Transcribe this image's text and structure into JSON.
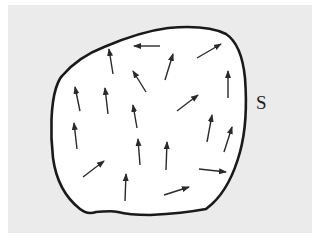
{
  "diagram": {
    "title": "",
    "background_color": "#ebebeb",
    "region_fill": "#ffffff",
    "outline_color": "#1a1a1a",
    "arrow_color": "#2a2a2a",
    "surface_label": "S",
    "region_path": "M 62 76 C 72 64 86 54 104 47 C 125 38 145 31 168 28 C 190 26 212 27 226 34 C 238 42 243 58 245 78 C 247 105 246 130 240 152 C 234 174 225 192 212 204 L 206 209 C 190 212 170 214 150 215 C 135 215 125 214 118 212 C 110 210 103 212 96 212 C 90 214 85 213 80 209 C 66 198 56 180 53 158 C 50 132 51 104 56 88 C 58 82 60 78 62 76 Z",
    "arrows": [
      {
        "x1": 160,
        "y1": 46,
        "x2": 134,
        "y2": 46
      },
      {
        "x1": 113,
        "y1": 74,
        "x2": 109,
        "y2": 49
      },
      {
        "x1": 146,
        "y1": 92,
        "x2": 133,
        "y2": 71
      },
      {
        "x1": 165,
        "y1": 80,
        "x2": 173,
        "y2": 54
      },
      {
        "x1": 197,
        "y1": 58,
        "x2": 221,
        "y2": 44
      },
      {
        "x1": 228,
        "y1": 98,
        "x2": 228,
        "y2": 71
      },
      {
        "x1": 80,
        "y1": 111,
        "x2": 75,
        "y2": 87
      },
      {
        "x1": 108,
        "y1": 114,
        "x2": 105,
        "y2": 88
      },
      {
        "x1": 137,
        "y1": 128,
        "x2": 133,
        "y2": 105
      },
      {
        "x1": 177,
        "y1": 111,
        "x2": 198,
        "y2": 95
      },
      {
        "x1": 77,
        "y1": 149,
        "x2": 74,
        "y2": 123
      },
      {
        "x1": 140,
        "y1": 165,
        "x2": 138,
        "y2": 139
      },
      {
        "x1": 166,
        "y1": 170,
        "x2": 167,
        "y2": 142
      },
      {
        "x1": 207,
        "y1": 142,
        "x2": 212,
        "y2": 115
      },
      {
        "x1": 224,
        "y1": 152,
        "x2": 232,
        "y2": 127
      },
      {
        "x1": 83,
        "y1": 177,
        "x2": 104,
        "y2": 161
      },
      {
        "x1": 125,
        "y1": 201,
        "x2": 126,
        "y2": 174
      },
      {
        "x1": 199,
        "y1": 169,
        "x2": 226,
        "y2": 172
      },
      {
        "x1": 164,
        "y1": 195,
        "x2": 189,
        "y2": 187
      }
    ]
  }
}
